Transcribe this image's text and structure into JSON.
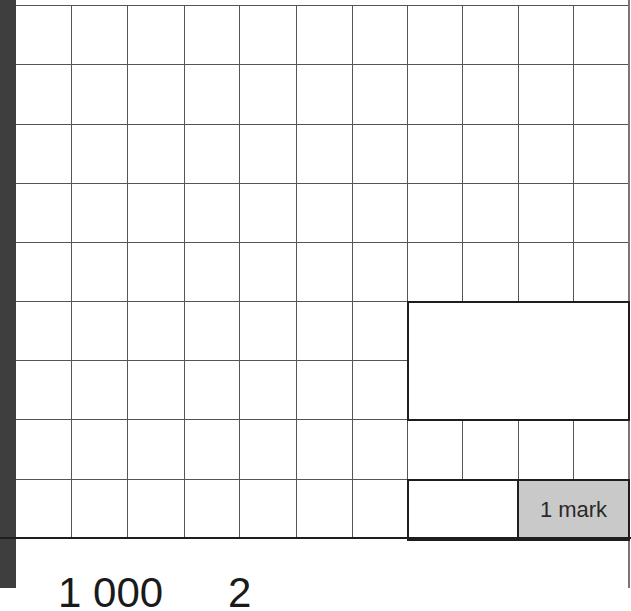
{
  "page": {
    "type": "exam-answer-grid",
    "grid": {
      "columns": 11,
      "rows": 9,
      "vertical_lines_x": [
        16,
        71,
        127,
        184,
        239,
        296,
        352,
        407,
        462,
        518,
        573
      ],
      "horizontal_lines_y": [
        0,
        59,
        119,
        178,
        237,
        296,
        355,
        414,
        474,
        533
      ],
      "line_color": "#555555"
    },
    "answer_box": {
      "label": ""
    },
    "small_answer_box": {
      "label": ""
    },
    "mark_box": {
      "label": "1 mark",
      "fill": "#c9c9c9"
    },
    "next_question_partial": {
      "part_1": "1 000",
      "part_2": "2"
    }
  }
}
